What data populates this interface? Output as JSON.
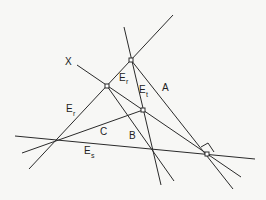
{
  "diagram": {
    "type": "geometric-construction",
    "colors": {
      "background": "#f7f7f5",
      "line": "#2a2a2a"
    },
    "labels": {
      "x": "X",
      "a": "A",
      "b": "B",
      "c": "C",
      "e_r_left": "E",
      "e_r_left_sub": "r",
      "e_r_top": "E",
      "e_r_top_sub": "r",
      "e_t": "E",
      "e_t_sub": "t",
      "e_s": "E",
      "e_s_sub": "s"
    },
    "points": [
      {
        "name": "vertex-top",
        "x": 131,
        "y": 60
      },
      {
        "name": "vertex-upper-left",
        "x": 107,
        "y": 86
      },
      {
        "name": "vertex-center",
        "x": 143,
        "y": 110
      },
      {
        "name": "vertex-right",
        "x": 207,
        "y": 154
      },
      {
        "name": "intersection-left",
        "x": 57,
        "y": 141
      },
      {
        "name": "intersection-middle",
        "x": 152,
        "y": 150
      }
    ],
    "lines": [
      {
        "name": "line-er",
        "label": "E_r",
        "from": [
          173,
          15
        ],
        "to": [
          29,
          169
        ]
      },
      {
        "name": "line-et",
        "label": "E_t",
        "from": [
          124,
          27
        ],
        "to": [
          161,
          185
        ]
      },
      {
        "name": "line-a",
        "label": "A",
        "from": [
          131,
          60
        ],
        "to": [
          233,
          189
        ]
      },
      {
        "name": "line-x",
        "label": "X",
        "from": [
          77,
          65
        ],
        "to": [
          241,
          177
        ]
      },
      {
        "name": "line-b",
        "label": "B",
        "from": [
          107,
          86
        ],
        "to": [
          174,
          181
        ]
      },
      {
        "name": "line-c",
        "label": "C",
        "from": [
          22,
          153
        ],
        "to": [
          143,
          110
        ]
      },
      {
        "name": "line-es",
        "label": "E_s",
        "from": [
          15,
          136
        ],
        "to": [
          255,
          159
        ]
      }
    ]
  }
}
